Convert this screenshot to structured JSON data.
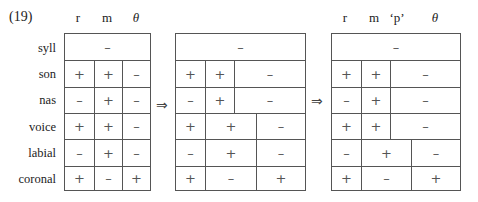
{
  "example_number": "(19)",
  "features": [
    "syll",
    "son",
    "nas",
    "voice",
    "labial",
    "coronal"
  ],
  "arrow": "⇒",
  "tables": [
    {
      "headers": [
        "r",
        "m",
        "θ"
      ],
      "rows": [
        [
          "–"
        ],
        [
          "+",
          "+",
          "–"
        ],
        [
          "–",
          "+",
          "–"
        ],
        [
          "+",
          "+",
          "–"
        ],
        [
          "–",
          "+",
          "–"
        ],
        [
          "+",
          "–",
          "+"
        ]
      ]
    },
    {
      "headers": [],
      "rows": [
        [
          "–"
        ],
        [
          "+",
          "+",
          "–"
        ],
        [
          "–",
          "+",
          "–"
        ],
        [
          "+",
          "+",
          "–"
        ],
        [
          "–",
          "+",
          "–"
        ],
        [
          "+",
          "–",
          "+"
        ]
      ]
    },
    {
      "headers": [
        "r",
        "m",
        "‘p’",
        "θ"
      ],
      "rows": [
        [
          "–"
        ],
        [
          "+",
          "+",
          "–"
        ],
        [
          "–",
          "+",
          "–"
        ],
        [
          "+",
          "+",
          "–"
        ],
        [
          "–",
          "+",
          "–"
        ],
        [
          "+",
          "–",
          "+"
        ]
      ]
    }
  ]
}
